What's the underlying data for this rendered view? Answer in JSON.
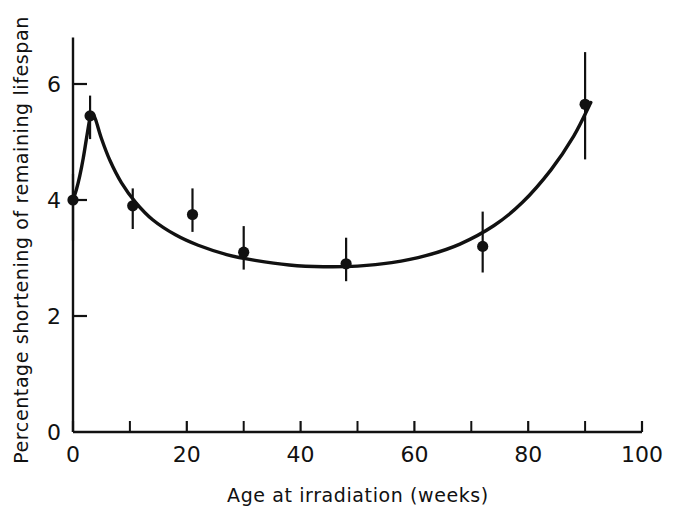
{
  "figure": {
    "background_color": "#ffffff",
    "ink_color": "#111111"
  },
  "chart_data": {
    "type": "scatter",
    "title": "",
    "xlabel": "Age at irradiation (weeks)",
    "ylabel": "Percentage shortening of remaining lifespan",
    "xlim": [
      0,
      100
    ],
    "ylim": [
      0,
      6.8
    ],
    "grid": false,
    "legend": null,
    "x_major_ticks": [
      0,
      20,
      40,
      60,
      80,
      100
    ],
    "x_major_tick_labels": [
      "0",
      "20",
      "40",
      "60",
      "80",
      "100"
    ],
    "x_minor_ticks": [
      10,
      30,
      50,
      70,
      90
    ],
    "y_major_ticks": [
      0,
      2,
      4,
      6
    ],
    "y_major_tick_labels": [
      "0",
      "2",
      "4",
      "6"
    ],
    "y_minor_ticks": [],
    "marker": "filled-circle",
    "errorbars": true,
    "points": [
      {
        "x": 0,
        "y": 4.0,
        "yerr_low": 3.3,
        "yerr_high": 4.45
      },
      {
        "x": 3,
        "y": 5.45,
        "yerr_low": 5.05,
        "yerr_high": 5.8
      },
      {
        "x": 10.5,
        "y": 3.9,
        "yerr_low": 3.5,
        "yerr_high": 4.2
      },
      {
        "x": 21,
        "y": 3.75,
        "yerr_low": 3.45,
        "yerr_high": 4.2
      },
      {
        "x": 30,
        "y": 3.1,
        "yerr_low": 2.8,
        "yerr_high": 3.55
      },
      {
        "x": 48,
        "y": 2.9,
        "yerr_low": 2.6,
        "yerr_high": 3.35
      },
      {
        "x": 72,
        "y": 3.2,
        "yerr_low": 2.75,
        "yerr_high": 3.8
      },
      {
        "x": 90,
        "y": 5.65,
        "yerr_low": 4.7,
        "yerr_high": 6.55
      }
    ],
    "fitted_curve": {
      "name": "fitted-curve",
      "x": [
        0,
        0.6,
        1.2,
        1.8,
        2.4,
        3.0,
        3.4,
        4.0,
        5.0,
        6.5,
        8.5,
        11,
        14,
        18,
        22,
        27,
        32,
        38,
        44,
        50,
        56,
        62,
        68,
        74,
        79,
        84,
        88,
        91
      ],
      "y": [
        4.0,
        4.18,
        4.42,
        4.72,
        5.08,
        5.42,
        5.5,
        5.38,
        5.06,
        4.68,
        4.3,
        3.96,
        3.66,
        3.4,
        3.22,
        3.06,
        2.96,
        2.88,
        2.85,
        2.86,
        2.92,
        3.04,
        3.24,
        3.56,
        3.96,
        4.52,
        5.1,
        5.68
      ]
    }
  }
}
